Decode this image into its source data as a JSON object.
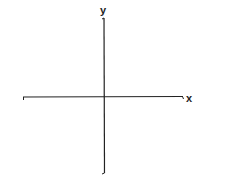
{
  "diagram": {
    "type": "coordinate-axes",
    "x_axis_label": "x",
    "y_axis_label": "y",
    "line_color": "#222222"
  }
}
